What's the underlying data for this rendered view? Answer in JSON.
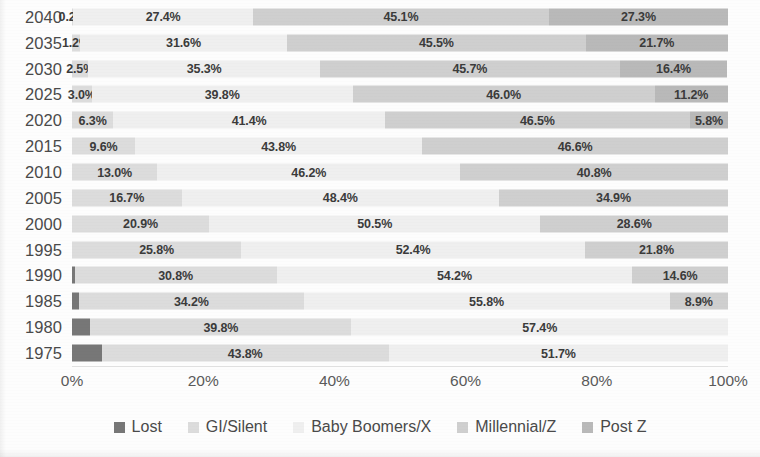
{
  "chart_data": {
    "type": "bar",
    "subtype": "stacked-horizontal-100pct",
    "title": "",
    "subtitle": "",
    "xlabel": "",
    "ylabel": "",
    "xlim": [
      0,
      100
    ],
    "xticks": [
      "0%",
      "20%",
      "40%",
      "60%",
      "80%",
      "100%"
    ],
    "xtick_values": [
      0,
      20,
      40,
      60,
      80,
      100
    ],
    "grid": false,
    "legend_position": "bottom",
    "categories": [
      "2040",
      "2035",
      "2030",
      "2025",
      "2020",
      "2015",
      "2010",
      "2005",
      "2000",
      "1995",
      "1990",
      "1985",
      "1980",
      "1975"
    ],
    "series": [
      {
        "name": "Lost",
        "color": "#777777",
        "values": [
          0,
          0,
          0,
          0,
          0,
          0,
          0,
          0,
          0,
          0,
          0.4,
          1.1,
          2.8,
          4.5
        ],
        "labels": [
          "",
          "",
          "",
          "",
          "",
          "",
          "",
          "",
          "",
          "",
          "",
          "",
          "",
          ""
        ]
      },
      {
        "name": "GI/Silent",
        "color": "#dcdcdc",
        "values": [
          0.2,
          1.2,
          2.5,
          3.0,
          6.3,
          9.6,
          13.0,
          16.7,
          20.9,
          25.8,
          30.8,
          34.2,
          39.8,
          43.8
        ],
        "labels": [
          "0.2%",
          "1.2%",
          "2.5%",
          "3.0%",
          "6.3%",
          "9.6%",
          "13.0%",
          "16.7%",
          "20.9%",
          "25.8%",
          "30.8%",
          "34.2%",
          "39.8%",
          "43.8%"
        ]
      },
      {
        "name": "Baby Boomers/X",
        "color": "#efefef",
        "values": [
          27.4,
          31.6,
          35.3,
          39.8,
          41.4,
          43.8,
          46.2,
          48.4,
          50.5,
          52.4,
          54.2,
          55.8,
          57.4,
          51.7
        ],
        "labels": [
          "27.4%",
          "31.6%",
          "35.3%",
          "39.8%",
          "41.4%",
          "43.8%",
          "46.2%",
          "48.4%",
          "50.5%",
          "52.4%",
          "54.2%",
          "55.8%",
          "57.4%",
          "51.7%"
        ]
      },
      {
        "name": "Millennial/Z",
        "color": "#cfcfcf",
        "values": [
          45.1,
          45.5,
          45.7,
          46.0,
          46.5,
          46.6,
          40.8,
          34.9,
          28.6,
          21.8,
          14.6,
          8.9,
          0,
          0
        ],
        "labels": [
          "45.1%",
          "45.5%",
          "45.7%",
          "46.0%",
          "46.5%",
          "46.6%",
          "40.8%",
          "34.9%",
          "28.6%",
          "21.8%",
          "14.6%",
          "8.9%",
          "",
          ""
        ]
      },
      {
        "name": "Post Z",
        "color": "#b9b9b9",
        "values": [
          27.3,
          21.7,
          16.4,
          11.2,
          5.8,
          0,
          0,
          0,
          0,
          0,
          0,
          0,
          0,
          0
        ],
        "labels": [
          "27.3%",
          "21.7%",
          "16.4%",
          "11.2%",
          "5.8%",
          "",
          "",
          "",
          "",
          "",
          "",
          "",
          "",
          ""
        ]
      }
    ]
  },
  "legend": {
    "items": [
      {
        "label": "Lost",
        "color": "#777777"
      },
      {
        "label": "GI/Silent",
        "color": "#dcdcdc"
      },
      {
        "label": "Baby Boomers/X",
        "color": "#efefef"
      },
      {
        "label": "Millennial/Z",
        "color": "#cfcfcf"
      },
      {
        "label": "Post Z",
        "color": "#b9b9b9"
      }
    ]
  },
  "colors": {
    "background": "#fdfdfd",
    "axis_text": "#5a5a5a",
    "label_text": "#3b3b3b",
    "axis_line": "#e2e2e2"
  }
}
